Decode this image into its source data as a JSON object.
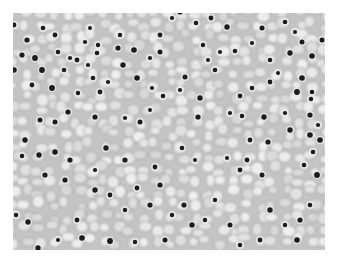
{
  "image": {
    "subject": "histology micrograph of tissue with clear cells and dark round nuclei",
    "colors": {
      "background": "#ffffff",
      "cytoplasm": "#dedede",
      "membrane": "#8f8f8f",
      "nucleus": "#1a1a1a"
    },
    "nuclei": [
      [
        14,
        25
      ],
      [
        27,
        40
      ],
      [
        22,
        55
      ],
      [
        35,
        58
      ],
      [
        58,
        52
      ],
      [
        70,
        58
      ],
      [
        77,
        60
      ],
      [
        42,
        70
      ],
      [
        64,
        70
      ],
      [
        90,
        28
      ],
      [
        85,
        42
      ],
      [
        98,
        45
      ],
      [
        97,
        53
      ],
      [
        55,
        35
      ],
      [
        43,
        28
      ],
      [
        14,
        70
      ],
      [
        32,
        85
      ],
      [
        52,
        88
      ],
      [
        93,
        78
      ],
      [
        108,
        82
      ],
      [
        100,
        92
      ],
      [
        78,
        93
      ],
      [
        88,
        65
      ],
      [
        120,
        35
      ],
      [
        123,
        65
      ],
      [
        134,
        50
      ],
      [
        150,
        58
      ],
      [
        160,
        35
      ],
      [
        160,
        52
      ],
      [
        137,
        78
      ],
      [
        152,
        88
      ],
      [
        163,
        96
      ],
      [
        172,
        18
      ],
      [
        180,
        12
      ],
      [
        196,
        23
      ],
      [
        203,
        45
      ],
      [
        211,
        18
      ],
      [
        227,
        27
      ],
      [
        208,
        60
      ],
      [
        215,
        70
      ],
      [
        220,
        52
      ],
      [
        235,
        51
      ],
      [
        252,
        43
      ],
      [
        262,
        28
      ],
      [
        285,
        22
      ],
      [
        295,
        32
      ],
      [
        290,
        53
      ],
      [
        302,
        42
      ],
      [
        312,
        56
      ],
      [
        322,
        40
      ],
      [
        270,
        60
      ],
      [
        270,
        82
      ],
      [
        278,
        73
      ],
      [
        302,
        78
      ],
      [
        297,
        92
      ],
      [
        312,
        92
      ],
      [
        311,
        99
      ],
      [
        252,
        88
      ],
      [
        240,
        96
      ],
      [
        242,
        116
      ],
      [
        230,
        113
      ],
      [
        200,
        98
      ],
      [
        185,
        77
      ],
      [
        180,
        90
      ],
      [
        150,
        110
      ],
      [
        140,
        122
      ],
      [
        198,
        117
      ],
      [
        264,
        117
      ],
      [
        285,
        113
      ],
      [
        310,
        115
      ],
      [
        318,
        125
      ],
      [
        125,
        118
      ],
      [
        95,
        117
      ],
      [
        68,
        112
      ],
      [
        55,
        122
      ],
      [
        40,
        120
      ],
      [
        25,
        140
      ],
      [
        39,
        155
      ],
      [
        55,
        152
      ],
      [
        22,
        156
      ],
      [
        45,
        175
      ],
      [
        70,
        160
      ],
      [
        65,
        180
      ],
      [
        95,
        170
      ],
      [
        95,
        190
      ],
      [
        110,
        195
      ],
      [
        106,
        148
      ],
      [
        125,
        160
      ],
      [
        137,
        188
      ],
      [
        155,
        167
      ],
      [
        160,
        185
      ],
      [
        125,
        210
      ],
      [
        150,
        205
      ],
      [
        172,
        215
      ],
      [
        165,
        240
      ],
      [
        184,
        205
      ],
      [
        192,
        225
      ],
      [
        205,
        220
      ],
      [
        215,
        200
      ],
      [
        230,
        225
      ],
      [
        240,
        170
      ],
      [
        247,
        160
      ],
      [
        227,
        158
      ],
      [
        262,
        175
      ],
      [
        270,
        210
      ],
      [
        285,
        225
      ],
      [
        300,
        220
      ],
      [
        297,
        240
      ],
      [
        310,
        205
      ],
      [
        317,
        175
      ],
      [
        304,
        165
      ],
      [
        313,
        152
      ],
      [
        320,
        140
      ],
      [
        310,
        135
      ],
      [
        290,
        130
      ],
      [
        268,
        142
      ],
      [
        250,
        140
      ],
      [
        195,
        160
      ],
      [
        182,
        148
      ],
      [
        77,
        220
      ],
      [
        82,
        238
      ],
      [
        58,
        240
      ],
      [
        38,
        248
      ],
      [
        28,
        222
      ],
      [
        110,
        241
      ],
      [
        135,
        242
      ],
      [
        260,
        240
      ],
      [
        240,
        245
      ],
      [
        16,
        215
      ],
      [
        118,
        48
      ]
    ]
  }
}
